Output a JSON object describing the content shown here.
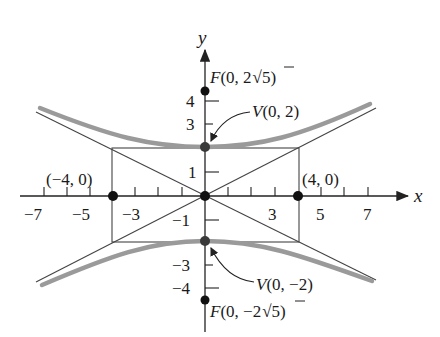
{
  "diagram": {
    "type": "hyperbola",
    "equation": "y^2/4 - x^2/16 = 1",
    "axes": {
      "x_label": "x",
      "y_label": "y",
      "x_ticks": [
        {
          "value": -7,
          "label": "−7"
        },
        {
          "value": -5,
          "label": "−5"
        },
        {
          "value": -3,
          "label": "−3"
        },
        {
          "value": 3,
          "label": "3"
        },
        {
          "value": 5,
          "label": "5"
        },
        {
          "value": 7,
          "label": "7"
        }
      ],
      "y_ticks": [
        {
          "value": 4,
          "label": "4"
        },
        {
          "value": 3,
          "label": "3"
        },
        {
          "value": 1,
          "label": "1"
        },
        {
          "value": -1,
          "label": "−1"
        },
        {
          "value": -3,
          "label": "−3"
        },
        {
          "value": -4,
          "label": "−4"
        }
      ]
    },
    "points": {
      "focus_top": {
        "name": "F",
        "coords": "(0, 2",
        "sqrt": "5",
        "close": ")"
      },
      "vertex_top": {
        "name": "V",
        "coords": "(0, 2)"
      },
      "vertex_bottom": {
        "name": "V",
        "coords": "(0, −2)"
      },
      "focus_bottom": {
        "name": "F",
        "coords": "(0, −2",
        "sqrt": "5",
        "close": ")"
      },
      "co_vertex_left": {
        "label": "(−4, 0)"
      },
      "co_vertex_right": {
        "label": "(4, 0)"
      },
      "origin": {
        "label": ""
      }
    },
    "colors": {
      "curve": "#9a9a9a",
      "lines": "#333333",
      "dots": "#111111",
      "vertex_dots": "#3a3a3a"
    }
  }
}
